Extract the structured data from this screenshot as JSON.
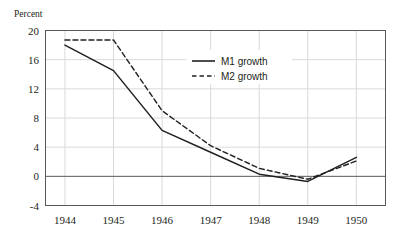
{
  "chart_data": {
    "type": "line",
    "title": "",
    "xlabel": "",
    "ylabel": "Percent",
    "x": [
      1944,
      1945,
      1946,
      1947,
      1948,
      1949,
      1950
    ],
    "xtick_labels": [
      "1944",
      "1945",
      "1946",
      "1947",
      "1948",
      "1949",
      "1950"
    ],
    "ytick_labels": [
      "20",
      "16",
      "12",
      "8",
      "4",
      "0",
      "-4"
    ],
    "ytick_values": [
      20,
      16,
      12,
      8,
      4,
      0,
      -4
    ],
    "ylim": [
      -4,
      20
    ],
    "xlim": [
      1943.6,
      1950.6
    ],
    "grid": "horizontal-and-vertical-light",
    "zero_line": 0,
    "legend_position": "inside-upper-center",
    "series": [
      {
        "name": "M1 growth",
        "style": "solid",
        "color": "#231f20",
        "values": [
          18.0,
          14.5,
          6.3,
          3.3,
          0.3,
          -0.7,
          2.6
        ]
      },
      {
        "name": "M2 growth",
        "style": "dashed",
        "color": "#231f20",
        "values": [
          18.7,
          18.7,
          9.0,
          4.2,
          1.1,
          -0.4,
          2.1
        ]
      }
    ]
  },
  "legend": {
    "entries": [
      {
        "label": "M1 growth",
        "style": "solid"
      },
      {
        "label": "M2 growth",
        "style": "dashed"
      }
    ]
  },
  "colors": {
    "ink": "#231f20",
    "grid": "#d9d9d9",
    "axis": "#595959",
    "background": "#ffffff"
  }
}
